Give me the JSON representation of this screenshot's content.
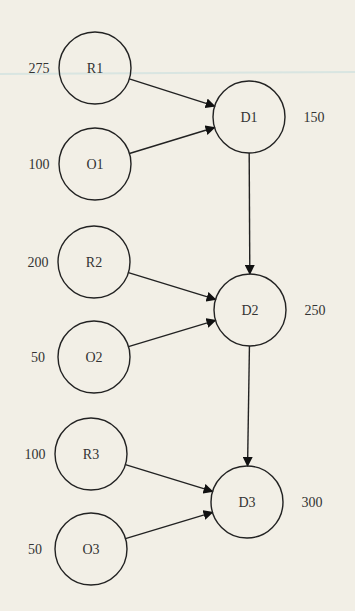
{
  "diagram": {
    "nodes": [
      {
        "id": "R1",
        "label": "R1",
        "value": "275",
        "cx": 95,
        "cy": 68
      },
      {
        "id": "O1",
        "label": "O1",
        "value": "100",
        "cx": 95,
        "cy": 164
      },
      {
        "id": "D1",
        "label": "D1",
        "value": "150",
        "cx": 249,
        "cy": 117
      },
      {
        "id": "R2",
        "label": "R2",
        "value": "200",
        "cx": 94,
        "cy": 262
      },
      {
        "id": "O2",
        "label": "O2",
        "value": "50",
        "cx": 94,
        "cy": 357
      },
      {
        "id": "D2",
        "label": "D2",
        "value": "250",
        "cx": 250,
        "cy": 310
      },
      {
        "id": "R3",
        "label": "R3",
        "value": "100",
        "cx": 91,
        "cy": 454
      },
      {
        "id": "O3",
        "label": "O3",
        "value": "50",
        "cx": 91,
        "cy": 549
      },
      {
        "id": "D3",
        "label": "D3",
        "value": "300",
        "cx": 247,
        "cy": 502
      }
    ],
    "edges": [
      {
        "from": "R1",
        "to": "D1"
      },
      {
        "from": "O1",
        "to": "D1"
      },
      {
        "from": "D1",
        "to": "D2"
      },
      {
        "from": "R2",
        "to": "D2"
      },
      {
        "from": "O2",
        "to": "D2"
      },
      {
        "from": "D2",
        "to": "D3"
      },
      {
        "from": "R3",
        "to": "D3"
      },
      {
        "from": "O3",
        "to": "D3"
      }
    ]
  }
}
